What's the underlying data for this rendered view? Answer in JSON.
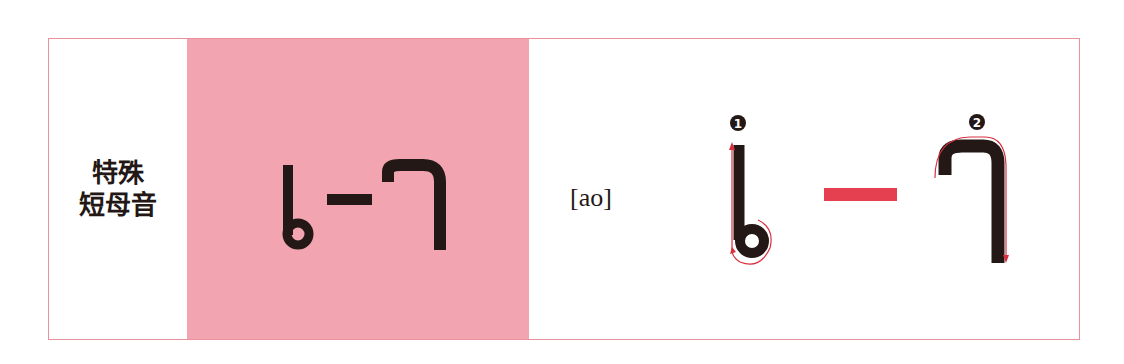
{
  "row": {
    "category_label_lines": [
      "特殊",
      "短母音"
    ],
    "letter_display": "ㅣ-ㄱ (special short vowel glyph)",
    "phonetic": "[ao]",
    "stroke_order": [
      {
        "number": "1",
        "description": "vertical stroke with loop at bottom"
      },
      {
        "number": "2",
        "description": "hooked stroke going right then down"
      }
    ]
  },
  "colors": {
    "border": "#e8909c",
    "pink_panel": "#f2a4b0",
    "dash": "#e5404f",
    "ink": "#231815",
    "stroke_arrow": "#d9303f"
  }
}
